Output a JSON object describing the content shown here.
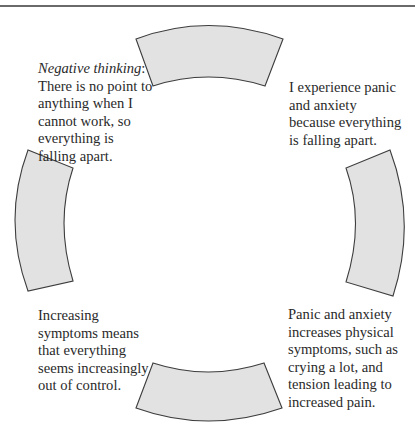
{
  "diagram": {
    "type": "cycle",
    "style": {
      "segment_fill": "#e2e2e2",
      "segment_stroke": "#3d3d3d",
      "rule_color": "#6a6a6a",
      "text_color": "#2a2a2a"
    },
    "segments": [
      {
        "position": "top"
      },
      {
        "position": "right"
      },
      {
        "position": "bottom"
      },
      {
        "position": "left"
      }
    ],
    "nodes": {
      "top_left": {
        "label_italic": "Negative thinking",
        "label_suffix": ":",
        "lines": [
          "There is no point to",
          "anything when I",
          "cannot work, so",
          "everything is",
          "falling apart."
        ]
      },
      "top_right": {
        "lines": [
          "I experience panic",
          "and anxiety",
          "because everything",
          "is falling apart."
        ]
      },
      "bottom_right": {
        "lines": [
          "Panic and anxiety",
          "increases physical",
          "symptoms, such as",
          "crying a lot, and",
          "tension leading to",
          "increased pain."
        ]
      },
      "bottom_left": {
        "lines": [
          "Increasing",
          "symptoms means",
          "that everything",
          "seems increasingly",
          "out of control."
        ]
      }
    }
  }
}
